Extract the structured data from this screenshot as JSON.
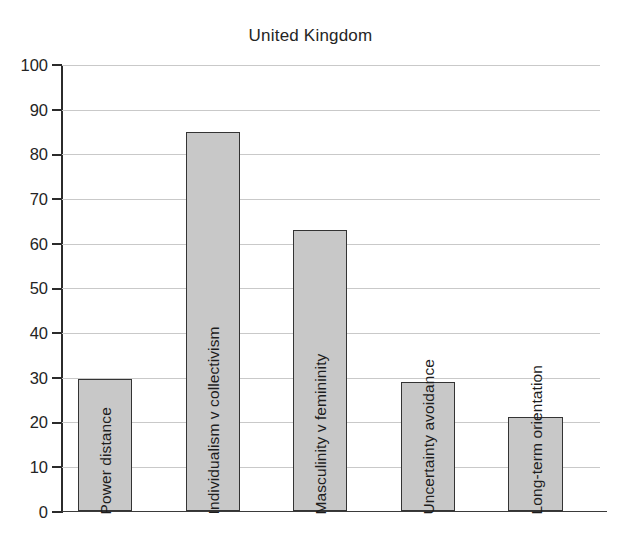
{
  "chart_data": {
    "type": "bar",
    "title": "United Kingdom",
    "xlabel": "",
    "ylabel": "",
    "ylim": [
      0,
      100
    ],
    "ytick_step": 10,
    "yticks": [
      100,
      90,
      80,
      70,
      60,
      50,
      40,
      30,
      20,
      10,
      0
    ],
    "grid": "horizontal",
    "legend": "none",
    "orientation": "vertical",
    "bar_label_rotation": "vertical",
    "categories": [
      "Power distance",
      "Individualism v collectivism",
      "Masculinity v femininity",
      "Uncertainty avoidance",
      "Long-term orientation"
    ],
    "values": [
      29.5,
      85,
      63,
      29,
      21
    ],
    "colors": {
      "bar_fill": "#c8c8c8",
      "bar_border": "#343434",
      "gridline": "#c9c9c9",
      "axis": "#2b2b2b",
      "text": "#1d1d1d",
      "background": "#ffffff"
    }
  },
  "axis": {
    "y_tick_labels": [
      "100",
      "90",
      "80",
      "70",
      "60",
      "50",
      "40",
      "30",
      "20",
      "10",
      "0"
    ]
  },
  "bars": [
    {
      "label": "Power distance",
      "value": "29.5"
    },
    {
      "label": "Individualism v collectivism",
      "value": "85"
    },
    {
      "label": "Masculinity v femininity",
      "value": "63"
    },
    {
      "label": "Uncertainty avoidance",
      "value": "29"
    },
    {
      "label": "Long-term orientation",
      "value": "21"
    }
  ]
}
